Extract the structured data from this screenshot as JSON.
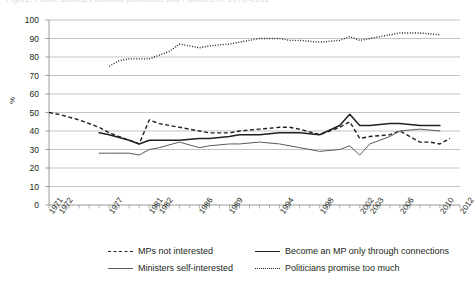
{
  "title_clipped": "Figure: Public attitudes towards politicians and Parliament, 1971–2012",
  "axes": {
    "ylabel": "%",
    "yticks": [
      "0",
      "10",
      "20",
      "30",
      "40",
      "50",
      "60",
      "70",
      "80",
      "90",
      "100"
    ],
    "xticks": [
      "1971",
      "1972",
      "1977",
      "1981",
      "1982",
      "1986",
      "1989",
      "1994",
      "1998",
      "2002",
      "2003",
      "2006",
      "2010",
      "2012"
    ]
  },
  "legend": {
    "items": [
      {
        "label": "MPs not interested",
        "style": "dashed",
        "color": "#231f20"
      },
      {
        "label": "Become an MP only through connections",
        "style": "solid",
        "color": "#231f20"
      },
      {
        "label": "Ministers self-interested",
        "style": "thin-solid",
        "color": "#5b5b5b"
      },
      {
        "label": "Politicians promise too much",
        "style": "dotted",
        "color": "#231f20"
      }
    ]
  },
  "chart_data": {
    "type": "line",
    "title": "",
    "xlabel": "",
    "ylabel": "%",
    "ylim": [
      0,
      100
    ],
    "ytick_step": 10,
    "grid": "horizontal",
    "legend_position": "bottom",
    "xlim": [
      1971,
      2012
    ],
    "tick_years": [
      "1971",
      "1972",
      "1977",
      "1981",
      "1982",
      "1986",
      "1989",
      "1994",
      "1998",
      "2002",
      "2003",
      "2006",
      "2010",
      "2012"
    ],
    "series": [
      {
        "name": "MPs not interested",
        "style": "dashed",
        "color": "#231f20",
        "points": [
          [
            1971,
            50
          ],
          [
            1972,
            49
          ],
          [
            1974,
            46
          ],
          [
            1976,
            42
          ],
          [
            1977,
            39
          ],
          [
            1978,
            37
          ],
          [
            1979,
            35
          ],
          [
            1980,
            33
          ],
          [
            1981,
            46
          ],
          [
            1982,
            44
          ],
          [
            1984,
            42
          ],
          [
            1986,
            40
          ],
          [
            1987,
            39
          ],
          [
            1989,
            39
          ],
          [
            1990,
            40
          ],
          [
            1992,
            41
          ],
          [
            1994,
            42
          ],
          [
            1995,
            42
          ],
          [
            1996,
            41
          ],
          [
            1998,
            38
          ],
          [
            2000,
            42
          ],
          [
            2001,
            45
          ],
          [
            2002,
            36
          ],
          [
            2003,
            37
          ],
          [
            2005,
            38
          ],
          [
            2006,
            40
          ],
          [
            2008,
            34
          ],
          [
            2009,
            34
          ],
          [
            2010,
            33
          ],
          [
            2011,
            36
          ]
        ]
      },
      {
        "name": "Become an MP only through connections",
        "style": "solid",
        "color": "#231f20",
        "points": [
          [
            1976,
            39
          ],
          [
            1977,
            38
          ],
          [
            1979,
            35
          ],
          [
            1980,
            33
          ],
          [
            1981,
            35
          ],
          [
            1982,
            35
          ],
          [
            1984,
            35
          ],
          [
            1986,
            36
          ],
          [
            1987,
            36
          ],
          [
            1989,
            37
          ],
          [
            1990,
            38
          ],
          [
            1992,
            38
          ],
          [
            1994,
            39
          ],
          [
            1996,
            39
          ],
          [
            1998,
            38
          ],
          [
            2000,
            43
          ],
          [
            2001,
            49
          ],
          [
            2002,
            43
          ],
          [
            2003,
            43
          ],
          [
            2005,
            44
          ],
          [
            2006,
            44
          ],
          [
            2008,
            43
          ],
          [
            2010,
            43
          ]
        ]
      },
      {
        "name": "Ministers self-interested",
        "style": "thin-solid",
        "color": "#5b5b5b",
        "points": [
          [
            1976,
            28
          ],
          [
            1977,
            28
          ],
          [
            1979,
            28
          ],
          [
            1980,
            27
          ],
          [
            1981,
            30
          ],
          [
            1982,
            31
          ],
          [
            1984,
            34
          ],
          [
            1986,
            31
          ],
          [
            1987,
            32
          ],
          [
            1989,
            33
          ],
          [
            1990,
            33
          ],
          [
            1992,
            34
          ],
          [
            1994,
            33
          ],
          [
            1996,
            31
          ],
          [
            1998,
            29
          ],
          [
            2000,
            30
          ],
          [
            2001,
            32
          ],
          [
            2002,
            27
          ],
          [
            2003,
            33
          ],
          [
            2005,
            37
          ],
          [
            2006,
            40
          ],
          [
            2008,
            41
          ],
          [
            2010,
            40
          ]
        ]
      },
      {
        "name": "Politicians promise too much",
        "style": "dotted",
        "color": "#231f20",
        "points": [
          [
            1977,
            75
          ],
          [
            1978,
            78
          ],
          [
            1979,
            79
          ],
          [
            1980,
            79
          ],
          [
            1981,
            79
          ],
          [
            1982,
            81
          ],
          [
            1983,
            83
          ],
          [
            1984,
            87
          ],
          [
            1985,
            86
          ],
          [
            1986,
            85
          ],
          [
            1987,
            86
          ],
          [
            1989,
            87
          ],
          [
            1990,
            88
          ],
          [
            1992,
            90
          ],
          [
            1994,
            90
          ],
          [
            1995,
            89
          ],
          [
            1996,
            89
          ],
          [
            1998,
            88
          ],
          [
            2000,
            89
          ],
          [
            2001,
            91
          ],
          [
            2002,
            89
          ],
          [
            2003,
            90
          ],
          [
            2005,
            92
          ],
          [
            2006,
            93
          ],
          [
            2008,
            93
          ],
          [
            2010,
            92
          ]
        ]
      }
    ]
  }
}
